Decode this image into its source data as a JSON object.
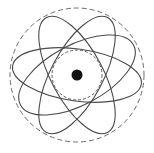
{
  "figure": {
    "width": 154,
    "height": 153,
    "background_color": "#ffffff"
  },
  "chart_data": {
    "type": "scatter",
    "title": "",
    "subtitle": "",
    "xlabel": "",
    "ylabel": "",
    "grid": false,
    "legend_position": "none",
    "center": {
      "x": 77,
      "y": 75
    },
    "nucleus": {
      "label": "nucleus",
      "cx": 77,
      "cy": 75,
      "r": 5.5,
      "fill": "#121212"
    },
    "inner_shell": {
      "label": "inner-shell-circle",
      "cx": 77,
      "cy": 75,
      "r": 25,
      "stroke": "#5a5a5a",
      "stroke_width": 1.0,
      "dash": "3 2"
    },
    "outer_boundary": {
      "label": "outer-boundary-circle",
      "cx": 77,
      "cy": 75,
      "r": 67,
      "stroke": "#6b6b6b",
      "stroke_width": 1.0,
      "dash": "5 3"
    },
    "orbits": [
      {
        "name": "orbit-1",
        "cx": 77,
        "cy": 75,
        "rx": 65,
        "ry": 26,
        "rotation": 8,
        "stroke": "#4a4a4a",
        "stroke_width": 1.1
      },
      {
        "name": "orbit-2",
        "cx": 77,
        "cy": 75,
        "rx": 65,
        "ry": 26,
        "rotation": 62,
        "stroke": "#4a4a4a",
        "stroke_width": 1.1
      },
      {
        "name": "orbit-3",
        "cx": 77,
        "cy": 75,
        "rx": 65,
        "ry": 26,
        "rotation": 118,
        "stroke": "#4a4a4a",
        "stroke_width": 1.1
      },
      {
        "name": "orbit-4",
        "cx": 77,
        "cy": 75,
        "rx": 64,
        "ry": 30,
        "rotation": 152,
        "stroke": "#4a4a4a",
        "stroke_width": 1.1
      }
    ],
    "colors": {
      "ink": "#4a4a4a",
      "nucleus": "#121212",
      "background": "#ffffff"
    }
  }
}
